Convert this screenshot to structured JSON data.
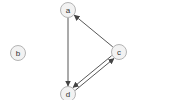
{
  "graph": {
    "directed": true,
    "nodes": [
      {
        "id": "a",
        "label": "a",
        "x": 68,
        "y": 10,
        "r": 7.5
      },
      {
        "id": "b",
        "label": "b",
        "x": 18,
        "y": 53,
        "r": 7.5
      },
      {
        "id": "c",
        "label": "c",
        "x": 119,
        "y": 52,
        "r": 7.5
      },
      {
        "id": "d",
        "label": "d",
        "x": 68,
        "y": 94,
        "r": 7.5
      }
    ],
    "edges": [
      {
        "from": "a",
        "to": "d"
      },
      {
        "from": "c",
        "to": "a"
      },
      {
        "from": "d",
        "to": "c"
      },
      {
        "from": "c",
        "to": "d"
      }
    ]
  },
  "colors": {
    "node_fill": "#f2f2f2",
    "node_stroke": "#b4b4b4",
    "edge": "#444444",
    "label": "#333333",
    "background": "#ffffff"
  }
}
